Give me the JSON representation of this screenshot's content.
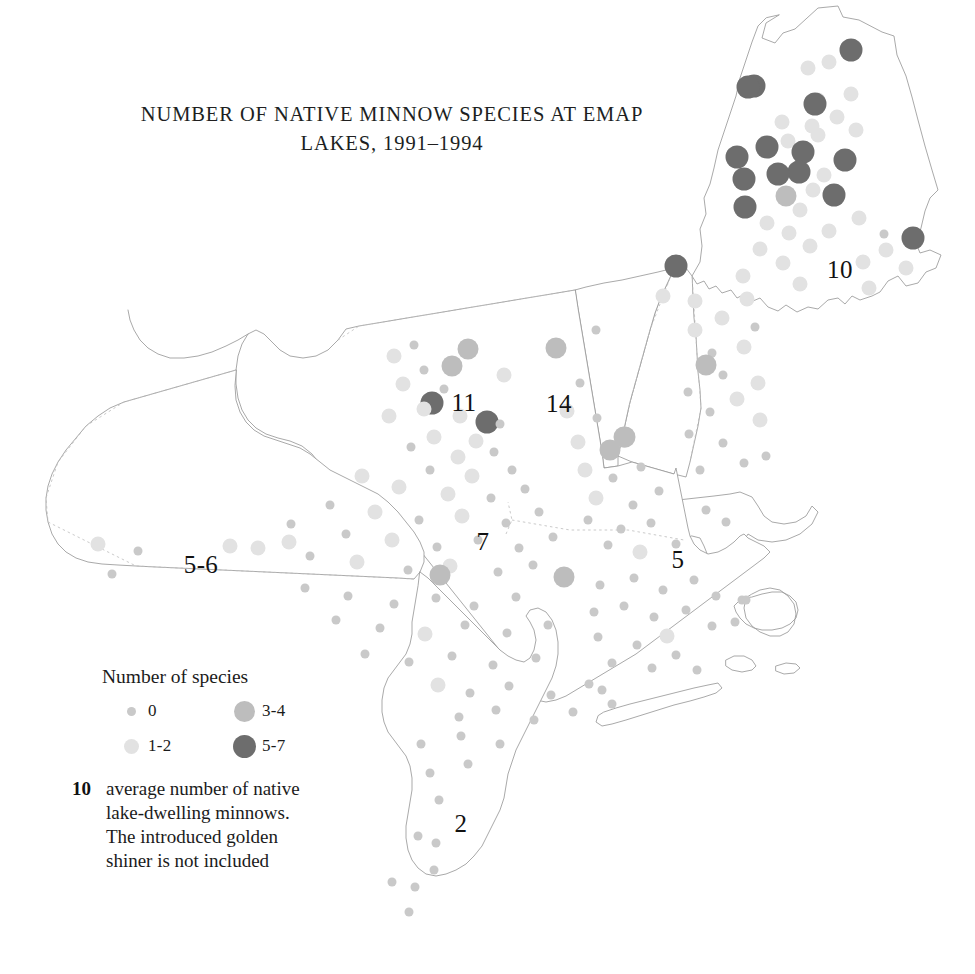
{
  "title": {
    "line1": "NUMBER OF NATIVE MINNOW SPECIES AT EMAP",
    "line2": "LAKES, 1991–1994"
  },
  "legend": {
    "heading": "Number of species",
    "classes": [
      {
        "label": "0",
        "size": 9,
        "color": "#c9c9c9"
      },
      {
        "label": "1-2",
        "size": 15,
        "color": "#e2e2e2"
      },
      {
        "label": "3-4",
        "size": 21,
        "color": "#bdbdbd"
      },
      {
        "label": "5-7",
        "size": 23,
        "color": "#6d6d6d"
      }
    ],
    "note_number": "10",
    "note_lines": [
      "average number of native",
      "lake-dwelling minnows.",
      "The introduced golden",
      "shiner is not included"
    ]
  },
  "region_labels": [
    {
      "name": "maine",
      "text": "10",
      "x": 840,
      "y": 270
    },
    {
      "name": "new-york",
      "text": "11",
      "x": 464,
      "y": 403
    },
    {
      "name": "vermont",
      "text": "14",
      "x": 559,
      "y": 404
    },
    {
      "name": "pennsylvania",
      "text": "5-6",
      "x": 201,
      "y": 565
    },
    {
      "name": "central-ny",
      "text": "7",
      "x": 483,
      "y": 542
    },
    {
      "name": "massachusetts",
      "text": "5",
      "x": 678,
      "y": 560
    },
    {
      "name": "new-jersey",
      "text": "2",
      "x": 461,
      "y": 824
    }
  ],
  "chart_data": {
    "type": "scatter",
    "xlabel": "",
    "ylabel": "",
    "legend_position": "bottom-left",
    "grid": false,
    "value_classes": [
      "0",
      "1-2",
      "3-4",
      "5-7"
    ],
    "region_averages": {
      "maine": 10,
      "new-york-adirondacks": 11,
      "vermont": 14,
      "pennsylvania": "5-6",
      "central-new-york": 7,
      "massachusetts": 5,
      "new-jersey": 2
    },
    "points": [
      {
        "x": 851,
        "y": 50,
        "c": 3
      },
      {
        "x": 808,
        "y": 68,
        "c": 1
      },
      {
        "x": 829,
        "y": 62,
        "c": 1
      },
      {
        "x": 754,
        "y": 86,
        "c": 3
      },
      {
        "x": 818,
        "y": 100,
        "c": 1
      },
      {
        "x": 851,
        "y": 94,
        "c": 1
      },
      {
        "x": 812,
        "y": 126,
        "c": 1
      },
      {
        "x": 837,
        "y": 117,
        "c": 1
      },
      {
        "x": 815,
        "y": 104,
        "c": 3
      },
      {
        "x": 782,
        "y": 122,
        "c": 1
      },
      {
        "x": 856,
        "y": 130,
        "c": 1
      },
      {
        "x": 748,
        "y": 87,
        "c": 3
      },
      {
        "x": 818,
        "y": 135,
        "c": 1
      },
      {
        "x": 788,
        "y": 141,
        "c": 1
      },
      {
        "x": 767,
        "y": 147,
        "c": 3
      },
      {
        "x": 803,
        "y": 152,
        "c": 3
      },
      {
        "x": 737,
        "y": 157,
        "c": 3
      },
      {
        "x": 845,
        "y": 160,
        "c": 3
      },
      {
        "x": 799,
        "y": 172,
        "c": 3
      },
      {
        "x": 778,
        "y": 174,
        "c": 3
      },
      {
        "x": 824,
        "y": 175,
        "c": 1
      },
      {
        "x": 744,
        "y": 179,
        "c": 3
      },
      {
        "x": 813,
        "y": 190,
        "c": 1
      },
      {
        "x": 786,
        "y": 196,
        "c": 2
      },
      {
        "x": 834,
        "y": 195,
        "c": 3
      },
      {
        "x": 745,
        "y": 207,
        "c": 3
      },
      {
        "x": 800,
        "y": 210,
        "c": 1
      },
      {
        "x": 859,
        "y": 218,
        "c": 1
      },
      {
        "x": 767,
        "y": 223,
        "c": 1
      },
      {
        "x": 913,
        "y": 238,
        "c": 3
      },
      {
        "x": 789,
        "y": 233,
        "c": 1
      },
      {
        "x": 829,
        "y": 231,
        "c": 1
      },
      {
        "x": 884,
        "y": 234,
        "c": 0
      },
      {
        "x": 810,
        "y": 246,
        "c": 1
      },
      {
        "x": 760,
        "y": 249,
        "c": 1
      },
      {
        "x": 886,
        "y": 250,
        "c": 1
      },
      {
        "x": 783,
        "y": 263,
        "c": 1
      },
      {
        "x": 863,
        "y": 262,
        "c": 1
      },
      {
        "x": 906,
        "y": 268,
        "c": 1
      },
      {
        "x": 743,
        "y": 276,
        "c": 1
      },
      {
        "x": 800,
        "y": 284,
        "c": 1
      },
      {
        "x": 869,
        "y": 288,
        "c": 1
      },
      {
        "x": 676,
        "y": 266,
        "c": 3
      },
      {
        "x": 663,
        "y": 296,
        "c": 1
      },
      {
        "x": 695,
        "y": 301,
        "c": 1
      },
      {
        "x": 722,
        "y": 318,
        "c": 1
      },
      {
        "x": 747,
        "y": 299,
        "c": 1
      },
      {
        "x": 695,
        "y": 330,
        "c": 1
      },
      {
        "x": 712,
        "y": 353,
        "c": 0
      },
      {
        "x": 744,
        "y": 347,
        "c": 1
      },
      {
        "x": 755,
        "y": 327,
        "c": 0
      },
      {
        "x": 723,
        "y": 375,
        "c": 0
      },
      {
        "x": 706,
        "y": 365,
        "c": 2
      },
      {
        "x": 758,
        "y": 383,
        "c": 1
      },
      {
        "x": 688,
        "y": 392,
        "c": 0
      },
      {
        "x": 737,
        "y": 399,
        "c": 1
      },
      {
        "x": 710,
        "y": 412,
        "c": 0
      },
      {
        "x": 760,
        "y": 420,
        "c": 1
      },
      {
        "x": 689,
        "y": 434,
        "c": 0
      },
      {
        "x": 723,
        "y": 443,
        "c": 0
      },
      {
        "x": 744,
        "y": 463,
        "c": 0
      },
      {
        "x": 700,
        "y": 470,
        "c": 0
      },
      {
        "x": 766,
        "y": 456,
        "c": 0
      },
      {
        "x": 625,
        "y": 437,
        "c": 2
      },
      {
        "x": 596,
        "y": 330,
        "c": 0
      },
      {
        "x": 556,
        "y": 348,
        "c": 2
      },
      {
        "x": 580,
        "y": 383,
        "c": 0
      },
      {
        "x": 567,
        "y": 411,
        "c": 1
      },
      {
        "x": 597,
        "y": 418,
        "c": 0
      },
      {
        "x": 578,
        "y": 442,
        "c": 1
      },
      {
        "x": 610,
        "y": 450,
        "c": 2
      },
      {
        "x": 624,
        "y": 437,
        "c": 2
      },
      {
        "x": 585,
        "y": 470,
        "c": 1
      },
      {
        "x": 613,
        "y": 478,
        "c": 0
      },
      {
        "x": 641,
        "y": 467,
        "c": 0
      },
      {
        "x": 596,
        "y": 498,
        "c": 1
      },
      {
        "x": 633,
        "y": 505,
        "c": 0
      },
      {
        "x": 659,
        "y": 491,
        "c": 0
      },
      {
        "x": 588,
        "y": 520,
        "c": 0
      },
      {
        "x": 621,
        "y": 529,
        "c": 0
      },
      {
        "x": 651,
        "y": 523,
        "c": 0
      },
      {
        "x": 608,
        "y": 545,
        "c": 0
      },
      {
        "x": 640,
        "y": 552,
        "c": 1
      },
      {
        "x": 676,
        "y": 544,
        "c": 0
      },
      {
        "x": 564,
        "y": 577,
        "c": 2
      },
      {
        "x": 600,
        "y": 585,
        "c": 0
      },
      {
        "x": 634,
        "y": 578,
        "c": 0
      },
      {
        "x": 663,
        "y": 590,
        "c": 0
      },
      {
        "x": 694,
        "y": 580,
        "c": 0
      },
      {
        "x": 716,
        "y": 596,
        "c": 0
      },
      {
        "x": 594,
        "y": 612,
        "c": 0
      },
      {
        "x": 624,
        "y": 606,
        "c": 0
      },
      {
        "x": 654,
        "y": 617,
        "c": 0
      },
      {
        "x": 686,
        "y": 610,
        "c": 0
      },
      {
        "x": 712,
        "y": 626,
        "c": 0
      },
      {
        "x": 742,
        "y": 600,
        "c": 0
      },
      {
        "x": 735,
        "y": 622,
        "c": 0
      },
      {
        "x": 598,
        "y": 637,
        "c": 0
      },
      {
        "x": 637,
        "y": 645,
        "c": 0
      },
      {
        "x": 667,
        "y": 636,
        "c": 1
      },
      {
        "x": 612,
        "y": 663,
        "c": 0
      },
      {
        "x": 652,
        "y": 668,
        "c": 0
      },
      {
        "x": 676,
        "y": 655,
        "c": 0
      },
      {
        "x": 697,
        "y": 670,
        "c": 0
      },
      {
        "x": 432,
        "y": 403,
        "c": 3
      },
      {
        "x": 487,
        "y": 422,
        "c": 3
      },
      {
        "x": 414,
        "y": 345,
        "c": 0
      },
      {
        "x": 394,
        "y": 356,
        "c": 1
      },
      {
        "x": 468,
        "y": 349,
        "c": 2
      },
      {
        "x": 424,
        "y": 370,
        "c": 0
      },
      {
        "x": 452,
        "y": 366,
        "c": 2
      },
      {
        "x": 403,
        "y": 384,
        "c": 1
      },
      {
        "x": 444,
        "y": 389,
        "c": 0
      },
      {
        "x": 504,
        "y": 375,
        "c": 1
      },
      {
        "x": 424,
        "y": 409,
        "c": 1
      },
      {
        "x": 460,
        "y": 416,
        "c": 1
      },
      {
        "x": 500,
        "y": 424,
        "c": 0
      },
      {
        "x": 389,
        "y": 416,
        "c": 1
      },
      {
        "x": 434,
        "y": 437,
        "c": 1
      },
      {
        "x": 476,
        "y": 441,
        "c": 1
      },
      {
        "x": 411,
        "y": 447,
        "c": 0
      },
      {
        "x": 458,
        "y": 457,
        "c": 1
      },
      {
        "x": 494,
        "y": 452,
        "c": 0
      },
      {
        "x": 430,
        "y": 470,
        "c": 0
      },
      {
        "x": 472,
        "y": 476,
        "c": 1
      },
      {
        "x": 512,
        "y": 470,
        "c": 0
      },
      {
        "x": 362,
        "y": 476,
        "c": 1
      },
      {
        "x": 399,
        "y": 487,
        "c": 1
      },
      {
        "x": 448,
        "y": 494,
        "c": 1
      },
      {
        "x": 491,
        "y": 498,
        "c": 0
      },
      {
        "x": 525,
        "y": 489,
        "c": 0
      },
      {
        "x": 330,
        "y": 505,
        "c": 0
      },
      {
        "x": 375,
        "y": 512,
        "c": 1
      },
      {
        "x": 419,
        "y": 520,
        "c": 0
      },
      {
        "x": 462,
        "y": 516,
        "c": 1
      },
      {
        "x": 506,
        "y": 523,
        "c": 0
      },
      {
        "x": 539,
        "y": 512,
        "c": 0
      },
      {
        "x": 291,
        "y": 524,
        "c": 0
      },
      {
        "x": 346,
        "y": 534,
        "c": 0
      },
      {
        "x": 392,
        "y": 540,
        "c": 1
      },
      {
        "x": 437,
        "y": 547,
        "c": 0
      },
      {
        "x": 478,
        "y": 540,
        "c": 0
      },
      {
        "x": 519,
        "y": 548,
        "c": 0
      },
      {
        "x": 553,
        "y": 537,
        "c": 0
      },
      {
        "x": 258,
        "y": 548,
        "c": 1
      },
      {
        "x": 310,
        "y": 556,
        "c": 0
      },
      {
        "x": 357,
        "y": 562,
        "c": 1
      },
      {
        "x": 408,
        "y": 570,
        "c": 0
      },
      {
        "x": 450,
        "y": 566,
        "c": 1
      },
      {
        "x": 498,
        "y": 572,
        "c": 0
      },
      {
        "x": 440,
        "y": 575,
        "c": 2
      },
      {
        "x": 533,
        "y": 565,
        "c": 0
      },
      {
        "x": 112,
        "y": 574,
        "c": 0
      },
      {
        "x": 98,
        "y": 544,
        "c": 1
      },
      {
        "x": 138,
        "y": 551,
        "c": 0
      },
      {
        "x": 230,
        "y": 546,
        "c": 1
      },
      {
        "x": 289,
        "y": 542,
        "c": 1
      },
      {
        "x": 305,
        "y": 588,
        "c": 0
      },
      {
        "x": 348,
        "y": 596,
        "c": 0
      },
      {
        "x": 394,
        "y": 604,
        "c": 0
      },
      {
        "x": 436,
        "y": 598,
        "c": 0
      },
      {
        "x": 474,
        "y": 606,
        "c": 0
      },
      {
        "x": 516,
        "y": 597,
        "c": 0
      },
      {
        "x": 336,
        "y": 620,
        "c": 0
      },
      {
        "x": 380,
        "y": 628,
        "c": 0
      },
      {
        "x": 425,
        "y": 634,
        "c": 1
      },
      {
        "x": 465,
        "y": 625,
        "c": 0
      },
      {
        "x": 507,
        "y": 633,
        "c": 0
      },
      {
        "x": 548,
        "y": 625,
        "c": 0
      },
      {
        "x": 365,
        "y": 654,
        "c": 0
      },
      {
        "x": 409,
        "y": 662,
        "c": 0
      },
      {
        "x": 452,
        "y": 656,
        "c": 0
      },
      {
        "x": 493,
        "y": 665,
        "c": 0
      },
      {
        "x": 536,
        "y": 658,
        "c": 0
      },
      {
        "x": 438,
        "y": 685,
        "c": 1
      },
      {
        "x": 470,
        "y": 693,
        "c": 0
      },
      {
        "x": 509,
        "y": 686,
        "c": 0
      },
      {
        "x": 551,
        "y": 695,
        "c": 0
      },
      {
        "x": 589,
        "y": 684,
        "c": 0
      },
      {
        "x": 459,
        "y": 717,
        "c": 0
      },
      {
        "x": 496,
        "y": 710,
        "c": 0
      },
      {
        "x": 534,
        "y": 720,
        "c": 0
      },
      {
        "x": 573,
        "y": 712,
        "c": 0
      },
      {
        "x": 612,
        "y": 704,
        "c": 0
      },
      {
        "x": 421,
        "y": 744,
        "c": 0
      },
      {
        "x": 461,
        "y": 736,
        "c": 0
      },
      {
        "x": 500,
        "y": 744,
        "c": 0
      },
      {
        "x": 430,
        "y": 773,
        "c": 0
      },
      {
        "x": 468,
        "y": 764,
        "c": 0
      },
      {
        "x": 439,
        "y": 800,
        "c": 0
      },
      {
        "x": 418,
        "y": 836,
        "c": 0
      },
      {
        "x": 436,
        "y": 843,
        "c": 0
      },
      {
        "x": 434,
        "y": 870,
        "c": 0
      },
      {
        "x": 415,
        "y": 887,
        "c": 0
      },
      {
        "x": 392,
        "y": 882,
        "c": 0
      },
      {
        "x": 409,
        "y": 912,
        "c": 0
      },
      {
        "x": 706,
        "y": 510,
        "c": 0
      },
      {
        "x": 726,
        "y": 522,
        "c": 0
      },
      {
        "x": 746,
        "y": 600,
        "c": 0
      },
      {
        "x": 602,
        "y": 690,
        "c": 0
      }
    ]
  }
}
